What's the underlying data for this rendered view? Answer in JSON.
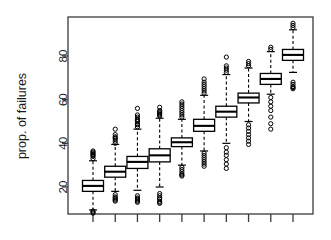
{
  "chart_data": {
    "type": "boxplot",
    "title": "",
    "xlabel": "",
    "ylabel": "prop. of failures",
    "ylim": [
      5,
      96
    ],
    "yticks": [
      20,
      40,
      60,
      80
    ],
    "ytick_labels": [
      "20",
      "40",
      "60",
      "80"
    ],
    "xticks": [
      1,
      2,
      3,
      4,
      5,
      6,
      7,
      8,
      9,
      10
    ],
    "xtick_labels": [
      "",
      "",
      "",
      "",
      "",
      "",
      "",
      "",
      "",
      ""
    ],
    "grid": false,
    "legend": null,
    "box_color": "#000000",
    "outlier_symbol": "open-circle",
    "whisker_style": "dashed",
    "categories": [
      "1",
      "2",
      "3",
      "4",
      "5",
      "6",
      "7",
      "8",
      "9",
      "10"
    ],
    "boxes": [
      {
        "category": "1",
        "lower_whisker": 9.5,
        "q1": 18.0,
        "median": 20.5,
        "q3": 23.0,
        "upper_whisker": 32.0,
        "outliers_high": [
          33.0,
          34.0,
          34.5,
          35.0,
          35.5,
          36.0,
          36.5
        ],
        "outliers_low": [
          9.0,
          8.5,
          8.0
        ]
      },
      {
        "category": "2",
        "lower_whisker": 18.0,
        "q1": 24.5,
        "median": 27.0,
        "q3": 29.5,
        "upper_whisker": 39.5,
        "outliers_high": [
          40.0,
          41.0,
          42.0,
          42.5,
          43.0,
          44.0,
          46.5
        ],
        "outliers_low": [
          16.5,
          15.5,
          15.0,
          14.5,
          14.0,
          13.5
        ]
      },
      {
        "category": "3",
        "lower_whisker": 18.5,
        "q1": 28.5,
        "median": 31.5,
        "q3": 34.0,
        "upper_whisker": 46.5,
        "outliers_high": [
          47.5,
          48.5,
          49.0,
          50.0,
          50.5,
          51.0,
          52.0,
          53.0,
          56.0
        ],
        "outliers_low": [
          16.0,
          15.0,
          14.5,
          14.0,
          13.5,
          13.0
        ]
      },
      {
        "category": "4",
        "lower_whisker": 20.0,
        "q1": 31.5,
        "median": 34.5,
        "q3": 37.5,
        "upper_whisker": 51.5,
        "outliers_high": [
          52.5,
          53.0,
          53.5,
          54.0,
          54.5,
          55.0,
          56.5
        ],
        "outliers_low": [
          17.0,
          16.0,
          15.0,
          14.5,
          13.5,
          13.0,
          12.5
        ]
      },
      {
        "category": "5",
        "lower_whisker": 30.0,
        "q1": 38.5,
        "median": 40.5,
        "q3": 42.5,
        "upper_whisker": 51.0,
        "outliers_high": [
          52.0,
          53.0,
          54.0,
          55.0,
          56.0,
          57.0,
          58.0,
          59.0
        ],
        "outliers_low": [
          29.0,
          28.0,
          27.0,
          26.0,
          25.5,
          25.0
        ]
      },
      {
        "category": "6",
        "lower_whisker": 36.5,
        "q1": 45.5,
        "median": 48.0,
        "q3": 51.0,
        "upper_whisker": 62.0,
        "outliers_high": [
          63.0,
          64.0,
          65.0,
          66.0,
          67.0,
          68.0,
          69.5
        ],
        "outliers_low": [
          35.5,
          34.5,
          33.5,
          32.5,
          31.5,
          30.5,
          29.5
        ]
      },
      {
        "category": "7",
        "lower_whisker": 40.0,
        "q1": 52.0,
        "median": 54.5,
        "q3": 57.0,
        "upper_whisker": 71.5,
        "outliers_high": [
          72.5,
          73.5,
          74.5,
          75.5,
          79.5
        ],
        "outliers_low": [
          38.0,
          36.0,
          34.5,
          32.5,
          30.5,
          28.5
        ]
      },
      {
        "category": "8",
        "lower_whisker": 50.0,
        "q1": 58.5,
        "median": 61.0,
        "q3": 63.0,
        "upper_whisker": 74.5,
        "outliers_high": [
          75.5,
          76.5,
          77.5
        ],
        "outliers_low": [
          48.5,
          47.0,
          45.5,
          44.0,
          42.5,
          41.0,
          39.5
        ]
      },
      {
        "category": "9",
        "lower_whisker": 62.5,
        "q1": 67.0,
        "median": 69.5,
        "q3": 72.0,
        "upper_whisker": 82.0,
        "outliers_high": [
          83.0,
          84.0
        ],
        "outliers_low": [
          61.0,
          59.0,
          57.0,
          55.0,
          52.0,
          49.0,
          46.5
        ]
      },
      {
        "category": "10",
        "lower_whisker": 72.5,
        "q1": 78.0,
        "median": 80.5,
        "q3": 83.0,
        "upper_whisker": 92.0,
        "outliers_high": [
          93.0,
          94.0,
          95.0
        ],
        "outliers_low": [
          68.0,
          67.0,
          66.0,
          65.5,
          65.0
        ]
      }
    ]
  },
  "axis": {
    "ylabel": "prop. of failures"
  }
}
